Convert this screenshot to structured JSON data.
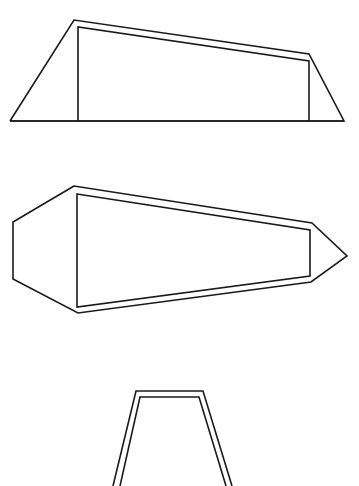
{
  "diagram": {
    "width": 359,
    "height": 486,
    "background": "#ffffff",
    "stroke_color": "#1a1a1a",
    "figures": [
      {
        "name": "figure-1-trapezoid-side-view",
        "outer": [
          [
            10,
            121
          ],
          [
            74,
            20
          ],
          [
            309,
            54
          ],
          [
            344,
            121
          ],
          [
            10,
            121
          ]
        ],
        "inner": [
          [
            78,
            121
          ],
          [
            78,
            27
          ],
          [
            309,
            61
          ],
          [
            309,
            121
          ]
        ],
        "baseline": [
          [
            10,
            121
          ],
          [
            344,
            121
          ]
        ]
      },
      {
        "name": "figure-2-hexagonal-top-view",
        "outer": [
          [
            74,
            186
          ],
          [
            13,
            222
          ],
          [
            13,
            279
          ],
          [
            78,
            313
          ],
          [
            311,
            282
          ],
          [
            347,
            256
          ],
          [
            312,
            223
          ]
        ],
        "inner": [
          [
            77,
            194
          ],
          [
            310,
            230
          ],
          [
            310,
            276
          ],
          [
            77,
            307
          ]
        ]
      },
      {
        "name": "figure-3-truncated-trapezoid",
        "outer": [
          [
            113,
            486
          ],
          [
            136,
            391
          ],
          [
            203,
            391
          ],
          [
            232,
            486
          ]
        ],
        "inner": [
          [
            120,
            486
          ],
          [
            140,
            397
          ],
          [
            199,
            397
          ],
          [
            226,
            486
          ]
        ]
      }
    ]
  }
}
